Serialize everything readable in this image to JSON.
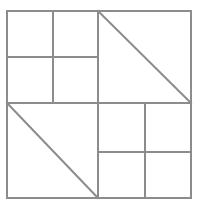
{
  "diagram": {
    "colors": {
      "background": "#ffffff",
      "stroke": "#8c8c8c"
    },
    "stroke_width": 2,
    "outer": {
      "x1": 7,
      "y1": 11,
      "x2": 191,
      "y2": 198
    },
    "center": {
      "x": 98,
      "y": 103
    },
    "quadrants": [
      {
        "position": "top-left",
        "type": "grid-2x2",
        "split_x": 53,
        "split_y": 57
      },
      {
        "position": "top-right",
        "type": "diagonal",
        "from": "top-left",
        "to": "bottom-right"
      },
      {
        "position": "bottom-left",
        "type": "diagonal",
        "from": "top-left",
        "to": "bottom-right"
      },
      {
        "position": "bottom-right",
        "type": "grid-2x2",
        "split_x": 145,
        "split_y": 152
      }
    ]
  }
}
